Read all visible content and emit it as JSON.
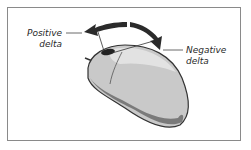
{
  "diagram": {
    "labels": {
      "positive": [
        "Positive",
        "delta"
      ],
      "negative": [
        "Negative",
        "delta"
      ]
    },
    "colors": {
      "arrow": "#2b2b2b",
      "mouse_body": "#c8c8c8",
      "mouse_shadow": "#8c8c8c",
      "outline": "#3a3a3a",
      "frame": "#8a8a8a"
    }
  }
}
